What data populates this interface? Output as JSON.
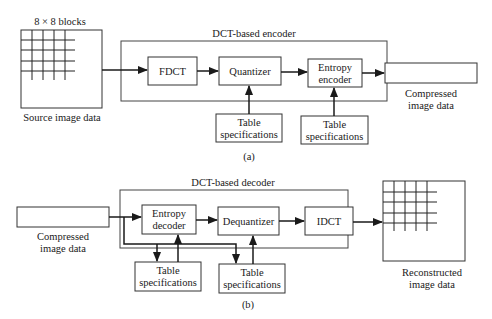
{
  "encoder": {
    "title": "DCT-based encoder",
    "source_label_top": "8 × 8 blocks",
    "source_label": "Source image data",
    "fdct": "FDCT",
    "quantizer": "Quantizer",
    "entropy_line1": "Entropy",
    "entropy_line2": "encoder",
    "output_line1": "Compressed",
    "output_line2": "image data",
    "table1_line1": "Table",
    "table1_line2": "specifications",
    "table2_line1": "Table",
    "table2_line2": "specifications",
    "sublabel": "(a)"
  },
  "decoder": {
    "title": "DCT-based decoder",
    "input_line1": "Compressed",
    "input_line2": "image data",
    "entropy_line1": "Entropy",
    "entropy_line2": "decoder",
    "dequantizer": "Dequantizer",
    "idct": "IDCT",
    "output_line1": "Reconstructed",
    "output_line2": "image data",
    "table1_line1": "Table",
    "table1_line2": "specifications",
    "table2_line1": "Table",
    "table2_line2": "specifications",
    "sublabel": "(b)"
  }
}
